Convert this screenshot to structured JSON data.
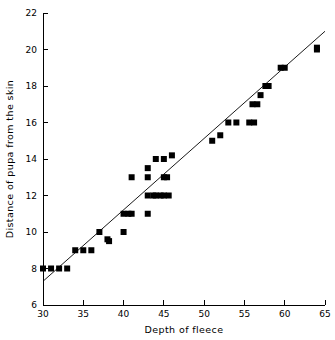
{
  "chart_data": {
    "type": "scatter",
    "title": "",
    "xlabel": "Depth of fleece",
    "ylabel": "Distance of pupa from the skin",
    "xlim": [
      30,
      65
    ],
    "ylim": [
      6,
      22
    ],
    "xticks": [
      30,
      35,
      40,
      45,
      50,
      55,
      60,
      65
    ],
    "yticks": [
      6,
      8,
      10,
      12,
      14,
      16,
      18,
      20,
      22
    ],
    "xtick_labels": [
      "30",
      "35",
      "40",
      "45",
      "50",
      "55",
      "60",
      "65"
    ],
    "ytick_labels": [
      "6",
      "8",
      "10",
      "12",
      "14",
      "16",
      "18",
      "20",
      "22"
    ],
    "grid": false,
    "legend": null,
    "marker": "square",
    "marker_color": "#000000",
    "points": [
      {
        "x": 30.0,
        "y": 8.0
      },
      {
        "x": 31.0,
        "y": 8.0
      },
      {
        "x": 32.0,
        "y": 8.0
      },
      {
        "x": 33.0,
        "y": 8.0
      },
      {
        "x": 34.0,
        "y": 9.0
      },
      {
        "x": 35.0,
        "y": 9.0
      },
      {
        "x": 36.0,
        "y": 9.0
      },
      {
        "x": 37.0,
        "y": 10.0
      },
      {
        "x": 38.0,
        "y": 9.6
      },
      {
        "x": 38.2,
        "y": 9.5
      },
      {
        "x": 40.0,
        "y": 10.0
      },
      {
        "x": 40.0,
        "y": 11.0
      },
      {
        "x": 40.6,
        "y": 11.0
      },
      {
        "x": 41.0,
        "y": 11.0
      },
      {
        "x": 41.0,
        "y": 13.0
      },
      {
        "x": 43.0,
        "y": 11.0
      },
      {
        "x": 43.0,
        "y": 12.0
      },
      {
        "x": 43.0,
        "y": 13.0
      },
      {
        "x": 43.0,
        "y": 13.5
      },
      {
        "x": 43.7,
        "y": 12.0
      },
      {
        "x": 44.0,
        "y": 12.0
      },
      {
        "x": 44.0,
        "y": 14.0
      },
      {
        "x": 44.6,
        "y": 12.0
      },
      {
        "x": 45.0,
        "y": 12.0
      },
      {
        "x": 45.0,
        "y": 13.0
      },
      {
        "x": 45.0,
        "y": 14.0
      },
      {
        "x": 45.4,
        "y": 13.0
      },
      {
        "x": 45.6,
        "y": 12.0
      },
      {
        "x": 46.0,
        "y": 14.2
      },
      {
        "x": 51.0,
        "y": 15.0
      },
      {
        "x": 52.0,
        "y": 15.3
      },
      {
        "x": 53.0,
        "y": 16.0
      },
      {
        "x": 54.0,
        "y": 16.0
      },
      {
        "x": 55.6,
        "y": 16.0
      },
      {
        "x": 56.2,
        "y": 16.0
      },
      {
        "x": 56.0,
        "y": 17.0
      },
      {
        "x": 56.6,
        "y": 17.0
      },
      {
        "x": 57.0,
        "y": 17.5
      },
      {
        "x": 57.6,
        "y": 18.0
      },
      {
        "x": 58.0,
        "y": 18.0
      },
      {
        "x": 59.5,
        "y": 19.0
      },
      {
        "x": 60.0,
        "y": 19.0
      },
      {
        "x": 64.0,
        "y": 20.0
      },
      {
        "x": 64.0,
        "y": 20.1
      }
    ],
    "fit_line": {
      "type": "linear-regression",
      "x0": 30.0,
      "y0": 7.3,
      "x1": 65.0,
      "y1": 21.0
    }
  }
}
